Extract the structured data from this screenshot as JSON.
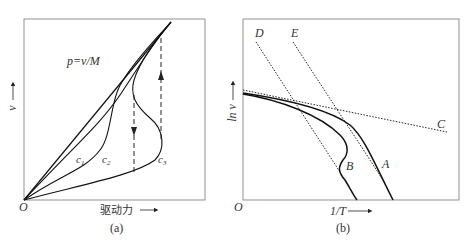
{
  "panel_a": {
    "caption": "(a)",
    "x_label": "驱动力",
    "y_label": "v",
    "origin": "O",
    "equation": "p=v/M",
    "curves": [
      "c1",
      "c2",
      "c3"
    ],
    "curve_labels": {
      "c1": "c",
      "c1_sub": "1",
      "c2": "c",
      "c2_sub": "2",
      "c3": "c",
      "c3_sub": "3"
    }
  },
  "panel_b": {
    "caption": "(b)",
    "x_label": "1/T",
    "y_label": "ln v",
    "origin": "O",
    "line_labels": [
      "D",
      "E",
      "C"
    ],
    "curve_labels": [
      "B",
      "A"
    ]
  },
  "colors": {
    "line": "#1a1a1a",
    "frame": "#555555",
    "text": "#333333"
  }
}
